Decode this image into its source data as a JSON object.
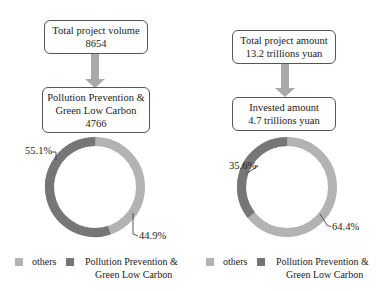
{
  "colors": {
    "others": "#b3b3b3",
    "pollution": "#767676",
    "arrow": "#a9a9a9",
    "border": "#555555"
  },
  "left": {
    "top_box": {
      "line1": "Total project volume",
      "line2": "8654"
    },
    "bottom_box": {
      "line1": "Pollution Prevention &",
      "line2": "Green Low Carbon",
      "line3": "4766"
    },
    "donut": {
      "pollution_label": "55.1%",
      "others_label": "44.9%"
    },
    "legend": {
      "others": "others",
      "pollution_line1": "Pollution Prevention &",
      "pollution_line2": "Green Low Carbon"
    }
  },
  "right": {
    "top_box": {
      "line1": "Total project amount",
      "line2": "13.2 trillions yuan"
    },
    "bottom_box": {
      "line1": "Invested amount",
      "line2": "4.7 trillions yuan"
    },
    "donut": {
      "pollution_label": "35.6%",
      "others_label": "64.4%"
    },
    "legend": {
      "others": "others",
      "pollution_line1": "Pollution Prevention &",
      "pollution_line2": "Green Low Carbon"
    }
  },
  "chart_data": [
    {
      "type": "pie",
      "variant": "donut",
      "title": "Total project volume 8654 → Pollution Prevention & Green Low Carbon 4766",
      "categories": [
        "others",
        "Pollution Prevention & Green Low Carbon"
      ],
      "values": [
        44.9,
        55.1
      ],
      "unit": "%",
      "legend_position": "bottom"
    },
    {
      "type": "pie",
      "variant": "donut",
      "title": "Total project amount 13.2 trillions yuan → Invested amount 4.7 trillions yuan",
      "categories": [
        "others",
        "Pollution Prevention & Green Low Carbon"
      ],
      "values": [
        64.4,
        35.6
      ],
      "unit": "%",
      "legend_position": "bottom"
    }
  ]
}
